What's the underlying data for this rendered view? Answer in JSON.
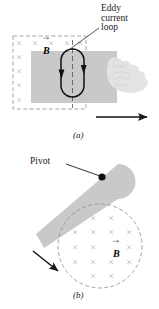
{
  "figure": {
    "caption_a": "(a)",
    "caption_b": "(b)",
    "background_color": "#ffffff",
    "ink_color": "#1a1a1a",
    "plate_color": "#c8c8c8",
    "field_mark_color": "#c0c0c0",
    "dash_border_color": "#9a9a9a",
    "hand_color": "#e2e2e2"
  },
  "panel_a": {
    "letter": "(a)",
    "callout": {
      "line1": "Eddy",
      "line2": "current",
      "line3": "loop"
    },
    "field_label": "B",
    "field_label_accent": "vector-arrow",
    "field_symbol": "×",
    "field_region_shape": "dashed-rectangle",
    "plate_shape": "rectangle",
    "loop_shape": "rounded-oval",
    "loop_current_direction": "downward-on-both-sides",
    "motion_arrow_direction": "right",
    "hand_present": true
  },
  "panel_b": {
    "letter": "(b)",
    "pivot_label": "Pivot",
    "field_label": "B",
    "field_label_accent": "vector-arrow",
    "field_symbol": "×",
    "field_region_shape": "dashed-circle",
    "plate_shape": "swinging-bar",
    "motion_arrow_direction": "down-left"
  }
}
